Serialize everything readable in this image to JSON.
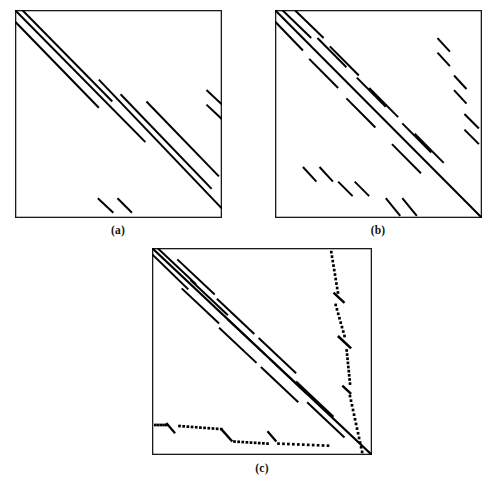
{
  "figure": {
    "type": "sparsity-pattern-figure",
    "background": "#ffffff",
    "ink_color": "#000000",
    "panels": [
      {
        "id": "a",
        "caption": "(a)",
        "box": {
          "x": 15,
          "y": 10,
          "w": 207,
          "h": 208
        },
        "caption_pos": {
          "x": 118,
          "y": 224
        },
        "description": "Banded matrix: three long parallel diagonal lines forming the main band, broken mid-way, plus two short off-diagonal pairs",
        "elements": {
          "lines": [
            {
              "name": "band-line-1",
              "x1": 0.0,
              "y1": 0.0,
              "x2": 0.63,
              "y2": 0.635,
              "w": 2.0
            },
            {
              "name": "band-line-2",
              "x1": 0.035,
              "y1": 0.0,
              "x2": 0.47,
              "y2": 0.44,
              "w": 2.0
            },
            {
              "name": "band-line-3",
              "x1": 0.0,
              "y1": 0.055,
              "x2": 0.405,
              "y2": 0.47,
              "w": 2.0
            },
            {
              "name": "band-line-4",
              "x1": 0.405,
              "y1": 0.335,
              "x2": 1.0,
              "y2": 0.955,
              "w": 2.0
            },
            {
              "name": "band-line-5",
              "x1": 0.51,
              "y1": 0.405,
              "x2": 0.95,
              "y2": 0.86,
              "w": 2.0
            },
            {
              "name": "band-line-6",
              "x1": 0.635,
              "y1": 0.44,
              "x2": 0.985,
              "y2": 0.8,
              "w": 2.0
            },
            {
              "name": "offdiag-top-right-1",
              "x1": 0.925,
              "y1": 0.385,
              "x2": 1.0,
              "y2": 0.455,
              "w": 2.0
            },
            {
              "name": "offdiag-top-right-2",
              "x1": 0.925,
              "y1": 0.455,
              "x2": 1.0,
              "y2": 0.525,
              "w": 2.0
            },
            {
              "name": "offdiag-bottom-1",
              "x1": 0.4,
              "y1": 0.905,
              "x2": 0.475,
              "y2": 0.975,
              "w": 2.0
            },
            {
              "name": "offdiag-bottom-2",
              "x1": 0.495,
              "y1": 0.905,
              "x2": 0.565,
              "y2": 0.975,
              "w": 2.0
            }
          ]
        }
      },
      {
        "id": "b",
        "caption": "(b)",
        "box": {
          "x": 275,
          "y": 10,
          "w": 207,
          "h": 208
        },
        "caption_pos": {
          "x": 378,
          "y": 224
        },
        "description": "Block-banded matrix: main diagonal band broken into many short dashes in three overlapping diagonal strips, plus scattered short off-diagonal pairs on the right side and along the bottom",
        "elements": {
          "lines": [
            {
              "name": "main-diagonal",
              "x1": 0.0,
              "y1": 0.0,
              "x2": 1.0,
              "y2": 1.0,
              "w": 2.0
            },
            {
              "name": "band-dash-u1",
              "x1": 0.035,
              "y1": 0.0,
              "x2": 0.175,
              "y2": 0.135,
              "w": 2.0
            },
            {
              "name": "band-dash-u2",
              "x1": 0.095,
              "y1": 0.0,
              "x2": 0.235,
              "y2": 0.135,
              "w": 2.0
            },
            {
              "name": "band-dash-u3",
              "x1": 0.0,
              "y1": 0.055,
              "x2": 0.135,
              "y2": 0.195,
              "w": 2.0
            },
            {
              "name": "band-dash-u4",
              "x1": 0.205,
              "y1": 0.135,
              "x2": 0.345,
              "y2": 0.275,
              "w": 2.0
            },
            {
              "name": "band-dash-u5",
              "x1": 0.265,
              "y1": 0.175,
              "x2": 0.405,
              "y2": 0.315,
              "w": 2.0
            },
            {
              "name": "band-dash-u6",
              "x1": 0.165,
              "y1": 0.235,
              "x2": 0.305,
              "y2": 0.375,
              "w": 2.0
            },
            {
              "name": "band-dash-m1",
              "x1": 0.395,
              "y1": 0.325,
              "x2": 0.535,
              "y2": 0.465,
              "w": 2.0
            },
            {
              "name": "band-dash-m2",
              "x1": 0.455,
              "y1": 0.375,
              "x2": 0.595,
              "y2": 0.515,
              "w": 2.0
            },
            {
              "name": "band-dash-m3",
              "x1": 0.345,
              "y1": 0.425,
              "x2": 0.485,
              "y2": 0.565,
              "w": 2.0
            },
            {
              "name": "band-dash-l1",
              "x1": 0.615,
              "y1": 0.545,
              "x2": 0.755,
              "y2": 0.685,
              "w": 2.0
            },
            {
              "name": "band-dash-l2",
              "x1": 0.675,
              "y1": 0.595,
              "x2": 0.815,
              "y2": 0.735,
              "w": 2.0
            },
            {
              "name": "band-dash-l3",
              "x1": 0.565,
              "y1": 0.645,
              "x2": 0.705,
              "y2": 0.785,
              "w": 2.0
            },
            {
              "name": "offdiag-r1-a",
              "x1": 0.785,
              "y1": 0.135,
              "x2": 0.845,
              "y2": 0.2,
              "w": 2.0
            },
            {
              "name": "offdiag-r1-b",
              "x1": 0.785,
              "y1": 0.205,
              "x2": 0.845,
              "y2": 0.27,
              "w": 2.0
            },
            {
              "name": "offdiag-r2-a",
              "x1": 0.865,
              "y1": 0.315,
              "x2": 0.925,
              "y2": 0.38,
              "w": 2.0
            },
            {
              "name": "offdiag-r2-b",
              "x1": 0.865,
              "y1": 0.385,
              "x2": 0.925,
              "y2": 0.45,
              "w": 2.0
            },
            {
              "name": "offdiag-r3-a",
              "x1": 0.915,
              "y1": 0.5,
              "x2": 0.985,
              "y2": 0.57,
              "w": 2.0
            },
            {
              "name": "offdiag-r3-b",
              "x1": 0.915,
              "y1": 0.575,
              "x2": 0.985,
              "y2": 0.645,
              "w": 2.0
            },
            {
              "name": "offdiag-b1-a",
              "x1": 0.135,
              "y1": 0.755,
              "x2": 0.2,
              "y2": 0.825,
              "w": 2.0
            },
            {
              "name": "offdiag-b1-b",
              "x1": 0.215,
              "y1": 0.755,
              "x2": 0.28,
              "y2": 0.825,
              "w": 2.0
            },
            {
              "name": "offdiag-b2-a",
              "x1": 0.305,
              "y1": 0.825,
              "x2": 0.375,
              "y2": 0.895,
              "w": 2.0
            },
            {
              "name": "offdiag-b2-b",
              "x1": 0.385,
              "y1": 0.825,
              "x2": 0.455,
              "y2": 0.895,
              "w": 2.0
            },
            {
              "name": "offdiag-b3-a",
              "x1": 0.535,
              "y1": 0.905,
              "x2": 0.605,
              "y2": 0.99,
              "w": 2.0
            },
            {
              "name": "offdiag-b3-b",
              "x1": 0.615,
              "y1": 0.905,
              "x2": 0.685,
              "y2": 0.99,
              "w": 2.0
            }
          ]
        }
      },
      {
        "id": "c",
        "caption": "(c)",
        "box": {
          "x": 152,
          "y": 248,
          "w": 220,
          "h": 207
        },
        "caption_pos": {
          "x": 262,
          "y": 462
        },
        "description": "Reordered matrix: dense banded diagonal of short dashes with a near-vertical dotted border column on the right and a horizontal dotted border row along the bottom",
        "elements": {
          "lines": [
            {
              "name": "main-diagonal",
              "x1": 0.0,
              "y1": 0.0,
              "x2": 1.0,
              "y2": 1.0,
              "w": 2.2
            },
            {
              "name": "band-upper-1",
              "x1": 0.025,
              "y1": 0.0,
              "x2": 0.2,
              "y2": 0.175,
              "w": 2.0
            },
            {
              "name": "band-upper-2",
              "x1": 0.0,
              "y1": 0.03,
              "x2": 0.165,
              "y2": 0.2,
              "w": 2.0
            },
            {
              "name": "band-dash-1",
              "x1": 0.115,
              "y1": 0.055,
              "x2": 0.285,
              "y2": 0.225,
              "w": 2.0
            },
            {
              "name": "band-dash-2",
              "x1": 0.175,
              "y1": 0.155,
              "x2": 0.345,
              "y2": 0.325,
              "w": 2.0
            },
            {
              "name": "band-dash-3",
              "x1": 0.135,
              "y1": 0.195,
              "x2": 0.305,
              "y2": 0.365,
              "w": 2.0
            },
            {
              "name": "band-dash-4",
              "x1": 0.295,
              "y1": 0.245,
              "x2": 0.465,
              "y2": 0.415,
              "w": 2.0
            },
            {
              "name": "band-dash-5",
              "x1": 0.345,
              "y1": 0.345,
              "x2": 0.515,
              "y2": 0.515,
              "w": 2.0
            },
            {
              "name": "band-dash-6",
              "x1": 0.305,
              "y1": 0.385,
              "x2": 0.475,
              "y2": 0.555,
              "w": 2.0
            },
            {
              "name": "band-dash-7",
              "x1": 0.485,
              "y1": 0.435,
              "x2": 0.655,
              "y2": 0.605,
              "w": 2.0
            },
            {
              "name": "band-dash-8",
              "x1": 0.535,
              "y1": 0.535,
              "x2": 0.705,
              "y2": 0.705,
              "w": 2.0
            },
            {
              "name": "band-dash-9",
              "x1": 0.495,
              "y1": 0.575,
              "x2": 0.665,
              "y2": 0.745,
              "w": 2.0
            },
            {
              "name": "band-dash-10",
              "x1": 0.655,
              "y1": 0.645,
              "x2": 0.825,
              "y2": 0.815,
              "w": 2.0
            },
            {
              "name": "band-dash-11",
              "x1": 0.705,
              "y1": 0.745,
              "x2": 0.875,
              "y2": 0.915,
              "w": 2.0
            },
            {
              "name": "border-dash-r1",
              "x1": 0.825,
              "y1": 0.215,
              "x2": 0.875,
              "y2": 0.265,
              "w": 2.4
            },
            {
              "name": "border-dash-r2",
              "x1": 0.845,
              "y1": 0.425,
              "x2": 0.905,
              "y2": 0.485,
              "w": 2.6
            },
            {
              "name": "border-dash-r3",
              "x1": 0.865,
              "y1": 0.665,
              "x2": 0.905,
              "y2": 0.705,
              "w": 2.4
            },
            {
              "name": "border-dash-b1",
              "x1": 0.065,
              "y1": 0.845,
              "x2": 0.105,
              "y2": 0.895,
              "w": 2.2
            },
            {
              "name": "border-dash-b2",
              "x1": 0.315,
              "y1": 0.875,
              "x2": 0.365,
              "y2": 0.935,
              "w": 2.4
            },
            {
              "name": "border-dash-b3",
              "x1": 0.525,
              "y1": 0.885,
              "x2": 0.565,
              "y2": 0.935,
              "w": 2.2
            }
          ],
          "dotted_runs": [
            {
              "name": "border-column-dots-upper",
              "x1": 0.815,
              "y1": 0.02,
              "x2": 0.845,
              "y2": 0.215,
              "count": 10
            },
            {
              "name": "border-column-dots-mid",
              "x1": 0.835,
              "y1": 0.275,
              "x2": 0.875,
              "y2": 0.425,
              "count": 8
            },
            {
              "name": "border-column-dots-lower",
              "x1": 0.885,
              "y1": 0.495,
              "x2": 0.9,
              "y2": 0.655,
              "count": 9
            },
            {
              "name": "border-column-dots-tail",
              "x1": 0.9,
              "y1": 0.715,
              "x2": 0.955,
              "y2": 0.985,
              "count": 13
            },
            {
              "name": "border-row-dots-left",
              "x1": 0.015,
              "y1": 0.855,
              "x2": 0.065,
              "y2": 0.855,
              "count": 5
            },
            {
              "name": "border-row-dots-mid",
              "x1": 0.125,
              "y1": 0.86,
              "x2": 0.315,
              "y2": 0.875,
              "count": 11
            },
            {
              "name": "border-row-dots-right",
              "x1": 0.375,
              "y1": 0.935,
              "x2": 0.525,
              "y2": 0.945,
              "count": 9
            },
            {
              "name": "border-row-dots-tail",
              "x1": 0.575,
              "y1": 0.945,
              "x2": 0.8,
              "y2": 0.955,
              "count": 11
            }
          ]
        }
      }
    ]
  }
}
